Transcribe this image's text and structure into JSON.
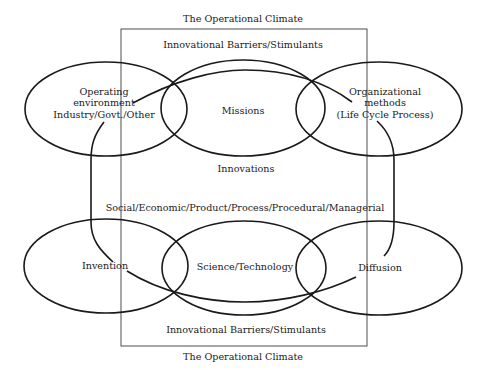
{
  "diagram": {
    "title_top": "The Operational Climate",
    "title_bottom": "The Operational Climate",
    "frame_label_top": "Innovational Barriers/Stimulants",
    "frame_label_bottom": "Innovational Barriers/Stimulants",
    "center_label": "Innovations",
    "innovation_types": "Social/Economic/Product/Process/Procedural/Managerial",
    "top_row": {
      "left": {
        "line1": "Operating",
        "line2": "environment",
        "line3": "Industry/Govt./Other"
      },
      "middle": "Missions",
      "right": {
        "line1": "Organizational",
        "line2": "methods",
        "line3": "(Life Cycle Process)"
      }
    },
    "bottom_row": {
      "left": "Invention",
      "middle": "Science/Technology",
      "right": "Diffusion"
    },
    "colors": {
      "stroke": "#1a1a1a",
      "background": "#ffffff"
    }
  }
}
